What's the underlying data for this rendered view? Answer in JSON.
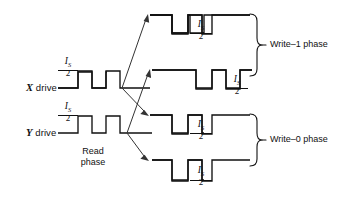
{
  "figure": {
    "type": "timing-waveform-diagram",
    "background_color": "#ffffff",
    "line_color": "#111111",
    "arrow_color": "#333333"
  },
  "labels": {
    "x_drive_axis": "X",
    "x_drive_text": " drive",
    "y_drive_axis": "Y",
    "y_drive_text": " drive",
    "read_phase_line1": "Read",
    "read_phase_line2": "phase",
    "write_one_phase": "Write–1 phase",
    "write_zero_phase": "Write–0 phase"
  },
  "amplitude_label": {
    "numerator": "I",
    "numerator_sub": "S",
    "denominator": "2",
    "text": "I_S/2"
  },
  "waveforms": [
    {
      "name": "x-drive-read",
      "drive": "X",
      "phase": "read",
      "amplitude_label": "I_S/2",
      "pulse_direction": "positive"
    },
    {
      "name": "y-drive-read",
      "drive": "Y",
      "phase": "read",
      "amplitude_label": "I_S/2",
      "pulse_direction": "positive"
    },
    {
      "name": "x-drive-write-1",
      "drive": "X",
      "phase": "write-1",
      "amplitude_label": "I_S/2",
      "pulse_direction": "negative"
    },
    {
      "name": "y-drive-write-1",
      "drive": "Y",
      "phase": "write-1",
      "amplitude_label": "I_S/2",
      "pulse_direction": "negative"
    },
    {
      "name": "x-drive-write-0",
      "drive": "X",
      "phase": "write-0",
      "amplitude_label": "I_S/2",
      "pulse_direction": "negative"
    },
    {
      "name": "y-drive-write-0",
      "drive": "Y",
      "phase": "write-0",
      "amplitude_label": "I_S/2",
      "pulse_direction": "negative"
    }
  ],
  "braces": [
    {
      "name": "write-1-brace",
      "label": "Write–1 phase"
    },
    {
      "name": "write-0-brace",
      "label": "Write–0 phase"
    }
  ],
  "branch_arrows": [
    {
      "name": "x-to-write1-top",
      "from": "x-drive-read-end",
      "to": "x-drive-write-1"
    },
    {
      "name": "x-to-write1-bottom",
      "from": "x-drive-read-end",
      "to": "y-drive-write-1"
    },
    {
      "name": "x-to-write0-top",
      "from": "x-drive-read-end",
      "to": "x-drive-write-0"
    },
    {
      "name": "y-to-write0-bottom",
      "from": "y-drive-read-end",
      "to": "y-drive-write-0"
    }
  ]
}
